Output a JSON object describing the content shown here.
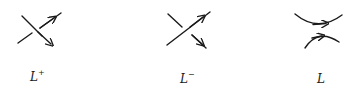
{
  "diagram": {
    "type": "skein-relation-crossings",
    "stroke_color": "#1a1a1a",
    "panels": [
      {
        "id": "positive-crossing",
        "label_base": "L",
        "label_sup": "+"
      },
      {
        "id": "negative-crossing",
        "label_base": "L",
        "label_sup": "−"
      },
      {
        "id": "smoothing",
        "label_base": "L",
        "label_sup": ""
      }
    ]
  }
}
